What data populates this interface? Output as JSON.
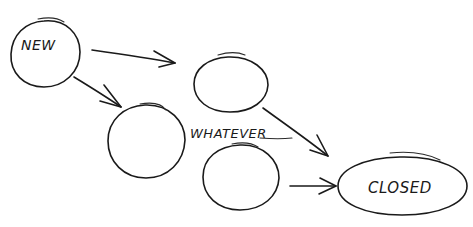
{
  "diagram": {
    "type": "state-diagram-sketch",
    "style": "hand-drawn",
    "colors": {
      "ink": "#1a1a1a",
      "background": "#ffffff"
    },
    "nodes": [
      {
        "id": "new",
        "label": "NEW",
        "shape": "circle"
      },
      {
        "id": "state_a",
        "label": "",
        "shape": "circle"
      },
      {
        "id": "state_b",
        "label": "",
        "shape": "circle"
      },
      {
        "id": "state_c",
        "label": "",
        "shape": "circle"
      },
      {
        "id": "closed",
        "label": "CLOSED",
        "shape": "ellipse"
      }
    ],
    "annotation": {
      "text": "WHATEVER"
    },
    "edges": [
      {
        "from": "new",
        "to": "state_a"
      },
      {
        "from": "new",
        "to": "state_b"
      },
      {
        "from": "state_a",
        "to": "closed"
      },
      {
        "from": "state_c",
        "to": "closed"
      }
    ]
  }
}
